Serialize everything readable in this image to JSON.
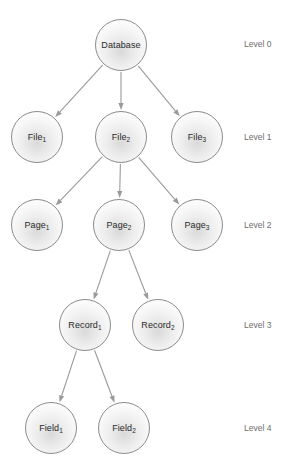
{
  "diagram": {
    "background_color": "#ffffff",
    "node_border_color": "#8c8c8c",
    "edge_color": "#9a9a9a",
    "label_color": "#2b2b2b",
    "level_label_color": "#6e6e6e",
    "node_diameter": 52,
    "nodes": [
      {
        "id": "database",
        "base": "Database",
        "sub": "",
        "cx": 121,
        "cy": 45,
        "r": 26
      },
      {
        "id": "file1",
        "base": "File",
        "sub": "1",
        "cx": 37,
        "cy": 137,
        "r": 26
      },
      {
        "id": "file2",
        "base": "File",
        "sub": "2",
        "cx": 121,
        "cy": 137,
        "r": 26
      },
      {
        "id": "file3",
        "base": "File",
        "sub": "3",
        "cx": 197,
        "cy": 137,
        "r": 26
      },
      {
        "id": "page1",
        "base": "Page",
        "sub": "1",
        "cx": 37,
        "cy": 225,
        "r": 26
      },
      {
        "id": "page2",
        "base": "Page",
        "sub": "2",
        "cx": 119,
        "cy": 225,
        "r": 26
      },
      {
        "id": "page3",
        "base": "Page",
        "sub": "3",
        "cx": 197,
        "cy": 225,
        "r": 26
      },
      {
        "id": "record1",
        "base": "Record",
        "sub": "1",
        "cx": 85,
        "cy": 325,
        "r": 26
      },
      {
        "id": "record2",
        "base": "Record",
        "sub": "2",
        "cx": 158,
        "cy": 325,
        "r": 26
      },
      {
        "id": "field1",
        "base": "Field",
        "sub": "1",
        "cx": 51,
        "cy": 428,
        "r": 26
      },
      {
        "id": "field2",
        "base": "Field",
        "sub": "2",
        "cx": 124,
        "cy": 428,
        "r": 26
      }
    ],
    "edges": [
      {
        "id": "database-file1",
        "from": "database",
        "to": "file1"
      },
      {
        "id": "database-file2",
        "from": "database",
        "to": "file2"
      },
      {
        "id": "database-file3",
        "from": "database",
        "to": "file3"
      },
      {
        "id": "file2-page1",
        "from": "file2",
        "to": "page1"
      },
      {
        "id": "file2-page2",
        "from": "file2",
        "to": "page2"
      },
      {
        "id": "file2-page3",
        "from": "file2",
        "to": "page3"
      },
      {
        "id": "page2-record1",
        "from": "page2",
        "to": "record1"
      },
      {
        "id": "page2-record2",
        "from": "page2",
        "to": "record2"
      },
      {
        "id": "record1-field1",
        "from": "record1",
        "to": "field1"
      },
      {
        "id": "record1-field2",
        "from": "record1",
        "to": "field2"
      }
    ],
    "level_labels": [
      {
        "id": "level-0",
        "text": "Level 0",
        "x": 244,
        "y": 40
      },
      {
        "id": "level-1",
        "text": "Level 1",
        "x": 244,
        "y": 133
      },
      {
        "id": "level-2",
        "text": "Level 2",
        "x": 244,
        "y": 221
      },
      {
        "id": "level-3",
        "text": "Level 3",
        "x": 244,
        "y": 321
      },
      {
        "id": "level-4",
        "text": "Level 4",
        "x": 244,
        "y": 424
      }
    ]
  }
}
